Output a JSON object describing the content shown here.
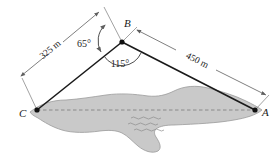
{
  "figure": {
    "background_color": "#ffffff",
    "line_color": "#1a1a1a",
    "dim_line_color": "#6e6e6e",
    "island_fill": "#c9c9c9",
    "island_stroke": "#9a9a9a",
    "dashed_color": "#8a8a8a"
  },
  "vertices": [
    {
      "id": "A",
      "label": "A",
      "x": 255,
      "y": 110,
      "label_x": 262,
      "label_y": 116
    },
    {
      "id": "B",
      "label": "B",
      "x": 122,
      "y": 42,
      "label_x": 124,
      "label_y": 26
    },
    {
      "id": "C",
      "label": "C",
      "x": 37,
      "y": 110,
      "label_x": 22,
      "label_y": 116
    }
  ],
  "sides": [
    {
      "id": "CB",
      "from": "C",
      "to": "B"
    },
    {
      "id": "BA",
      "from": "B",
      "to": "A"
    },
    {
      "id": "CA",
      "from": "C",
      "to": "A",
      "style": "dashed"
    }
  ],
  "dimensions": [
    {
      "id": "dim-325",
      "label": "325 m",
      "value": 325,
      "unit": "m",
      "for_side": "CB",
      "text_x": 52,
      "text_y": 52,
      "rotation": -41
    },
    {
      "id": "dim-450",
      "label": "450 m",
      "value": 450,
      "unit": "m",
      "for_side": "BA",
      "text_x": 196,
      "text_y": 60,
      "rotation": 27
    }
  ],
  "angles": [
    {
      "id": "angle-65",
      "label": "65°",
      "value": 65,
      "at_vertex": "B",
      "text_x": 84,
      "text_y": 46
    },
    {
      "id": "angle-115",
      "label": "115°",
      "value": 115,
      "at_vertex": "B",
      "text_x": 104,
      "text_y": 65
    }
  ],
  "water_marks": [
    {
      "id": "wave-1"
    },
    {
      "id": "wave-2"
    },
    {
      "id": "wave-3"
    }
  ]
}
